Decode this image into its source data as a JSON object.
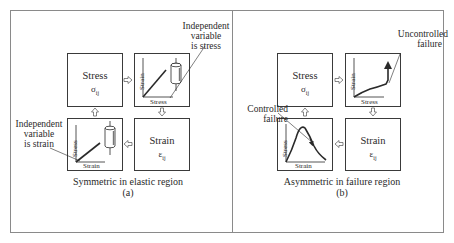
{
  "panel_a": {
    "caption": "Symmetric in elastic region",
    "sublabel": "(a)",
    "stress_box": {
      "title": "Stress",
      "symbol": "σ",
      "subscript": "ij"
    },
    "strain_box": {
      "title": "Strain",
      "symbol": "ε",
      "subscript": "ij"
    },
    "graph_tr": {
      "x_label": "Stress",
      "y_label": "Strain"
    },
    "graph_bl": {
      "x_label": "Strain",
      "y_label": "Stress"
    },
    "annotation_tr": [
      "Independent",
      "variable",
      "is stress"
    ],
    "annotation_bl": [
      "Independent",
      "variable",
      "is strain"
    ]
  },
  "panel_b": {
    "caption": "Asymmetric in failure region",
    "sublabel": "(b)",
    "stress_box": {
      "title": "Stress",
      "symbol": "σ",
      "subscript": "ij"
    },
    "strain_box": {
      "title": "Strain",
      "symbol": "ε",
      "subscript": "ij"
    },
    "graph_tr": {
      "x_label": "Stress",
      "y_label": "Strain"
    },
    "graph_bl": {
      "x_label": "Strain",
      "y_label": "Stress"
    },
    "annotation_tr": [
      "Uncontrolled",
      "failure"
    ],
    "annotation_bl": [
      "Controlled",
      "failure"
    ]
  },
  "colors": {
    "line": "#2a2a2a",
    "frame": "#8a8a8a"
  }
}
